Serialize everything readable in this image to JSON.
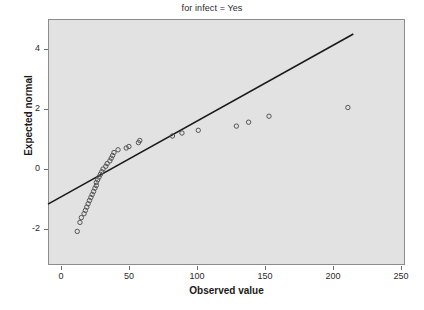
{
  "chart_data": {
    "type": "scatter",
    "title": "for infect = Yes",
    "xlabel": "Observed value",
    "ylabel": "Expected normal",
    "xlim": [
      -9.5,
      253
    ],
    "ylim": [
      -3.2,
      5.0
    ],
    "xticks": [
      0,
      50,
      100,
      150,
      200,
      250
    ],
    "xtick_labels": [
      "0",
      "50",
      "100",
      "150",
      "200",
      "250"
    ],
    "yticks": [
      -2,
      0,
      2,
      4
    ],
    "ytick_labels": [
      "-2",
      "0",
      "2",
      "4"
    ],
    "grid": false,
    "legend": false,
    "panel_color": "#e2e2e2",
    "marker_color": "#555555",
    "marker_shape": "open-circle",
    "line_color": "#1a1a1a",
    "reference_line": {
      "x": [
        -9.5,
        215
      ],
      "y": [
        -1.17,
        4.5
      ]
    },
    "points": [
      {
        "x": 12,
        "y": -2.08
      },
      {
        "x": 14,
        "y": -1.78
      },
      {
        "x": 15,
        "y": -1.62
      },
      {
        "x": 17,
        "y": -1.49
      },
      {
        "x": 18,
        "y": -1.38
      },
      {
        "x": 19,
        "y": -1.27
      },
      {
        "x": 20,
        "y": -1.16
      },
      {
        "x": 21,
        "y": -1.05
      },
      {
        "x": 22,
        "y": -0.95
      },
      {
        "x": 23,
        "y": -0.85
      },
      {
        "x": 24,
        "y": -0.75
      },
      {
        "x": 25,
        "y": -0.64
      },
      {
        "x": 26,
        "y": -0.55
      },
      {
        "x": 26,
        "y": -0.45
      },
      {
        "x": 27,
        "y": -0.36
      },
      {
        "x": 28,
        "y": -0.27
      },
      {
        "x": 29,
        "y": -0.18
      },
      {
        "x": 30,
        "y": -0.09
      },
      {
        "x": 31,
        "y": 0.0
      },
      {
        "x": 33,
        "y": 0.09
      },
      {
        "x": 34,
        "y": 0.18
      },
      {
        "x": 36,
        "y": 0.27
      },
      {
        "x": 37,
        "y": 0.36
      },
      {
        "x": 38,
        "y": 0.45
      },
      {
        "x": 39,
        "y": 0.55
      },
      {
        "x": 42,
        "y": 0.64
      },
      {
        "x": 48,
        "y": 0.7
      },
      {
        "x": 50,
        "y": 0.75
      },
      {
        "x": 57,
        "y": 0.88
      },
      {
        "x": 58,
        "y": 0.95
      },
      {
        "x": 82,
        "y": 1.1
      },
      {
        "x": 89,
        "y": 1.2
      },
      {
        "x": 101,
        "y": 1.29
      },
      {
        "x": 129,
        "y": 1.43
      },
      {
        "x": 138,
        "y": 1.56
      },
      {
        "x": 153,
        "y": 1.76
      },
      {
        "x": 211,
        "y": 2.05
      }
    ]
  }
}
